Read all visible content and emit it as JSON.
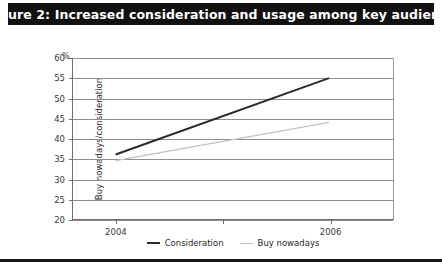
{
  "figure": {
    "title": "Figure 2: Increased consideration and usage among key audience"
  },
  "chart_data": {
    "type": "line",
    "title": "Figure 2: Increased consideration and usage among key audience",
    "xlabel": "",
    "ylabel": "Buy nowadays/consideration",
    "unit_label": "%",
    "categories": [
      "2004",
      "2006"
    ],
    "x": [
      2004,
      2006
    ],
    "xticks": [
      "2004",
      "2006"
    ],
    "xlim": [
      2003.6,
      2006.6
    ],
    "ylim": [
      20,
      60
    ],
    "yticks": [
      20,
      25,
      30,
      35,
      40,
      45,
      50,
      55,
      60
    ],
    "ytick_labels": [
      "20",
      "25",
      "30",
      "35",
      "40",
      "45",
      "50",
      "55",
      "60"
    ],
    "grid": true,
    "legend_position": "bottom",
    "series": [
      {
        "name": "Consideration",
        "values": [
          36,
          55
        ],
        "color": "#2b2b2b",
        "width": 2.1
      },
      {
        "name": "Buy nowadays",
        "values": [
          34.5,
          44
        ],
        "color": "#c2c2c2",
        "width": 1.2
      }
    ]
  }
}
